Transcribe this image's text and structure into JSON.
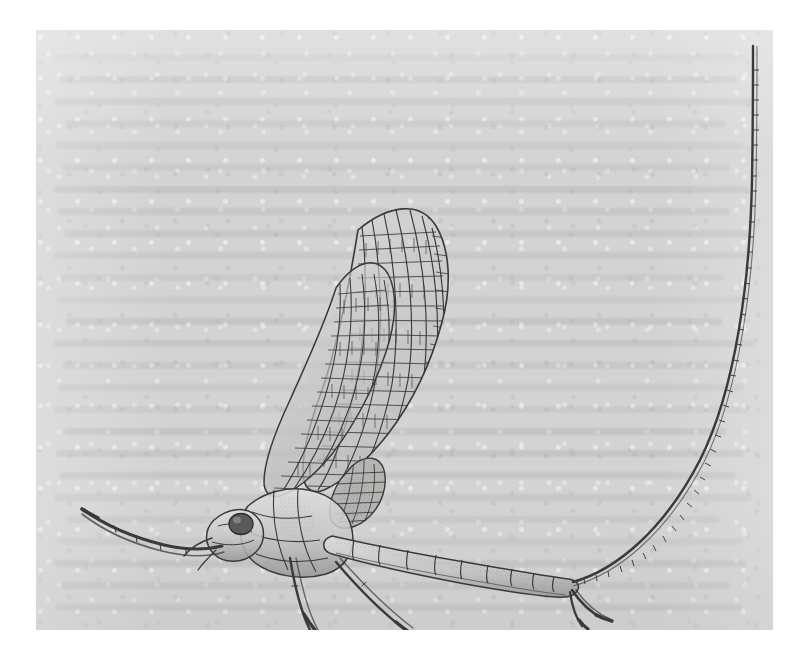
{
  "figure": {
    "subject_name": "mayfly-lateral-illustration",
    "title": "",
    "caption": "",
    "medium": "pen-and-ink line drawing",
    "view": "lateral",
    "plate": {
      "left": 36,
      "top": 30,
      "width": 737,
      "height": 600,
      "background_color": "#d2d3d2",
      "page_color": "#ffffff",
      "ink_color": "#3a3a38"
    },
    "background_marks": {
      "kind": "verso-bleed-through-text",
      "legible": false,
      "lines": [
        {
          "x": 18,
          "y": 24,
          "w": 690
        },
        {
          "x": 24,
          "y": 46,
          "w": 676
        },
        {
          "x": 18,
          "y": 68,
          "w": 700
        },
        {
          "x": 30,
          "y": 90,
          "w": 660
        },
        {
          "x": 20,
          "y": 112,
          "w": 688
        },
        {
          "x": 26,
          "y": 134,
          "w": 668
        },
        {
          "x": 18,
          "y": 156,
          "w": 694
        },
        {
          "x": 22,
          "y": 178,
          "w": 672
        },
        {
          "x": 28,
          "y": 200,
          "w": 684
        },
        {
          "x": 18,
          "y": 222,
          "w": 698
        },
        {
          "x": 24,
          "y": 244,
          "w": 664
        },
        {
          "x": 20,
          "y": 266,
          "w": 690
        },
        {
          "x": 30,
          "y": 288,
          "w": 656
        },
        {
          "x": 18,
          "y": 310,
          "w": 700
        },
        {
          "x": 26,
          "y": 332,
          "w": 670
        },
        {
          "x": 22,
          "y": 354,
          "w": 686
        },
        {
          "x": 18,
          "y": 376,
          "w": 694
        },
        {
          "x": 28,
          "y": 398,
          "w": 662
        },
        {
          "x": 20,
          "y": 420,
          "w": 688
        },
        {
          "x": 24,
          "y": 442,
          "w": 676
        },
        {
          "x": 18,
          "y": 464,
          "w": 698
        },
        {
          "x": 30,
          "y": 486,
          "w": 654
        },
        {
          "x": 22,
          "y": 508,
          "w": 684
        },
        {
          "x": 18,
          "y": 530,
          "w": 692
        },
        {
          "x": 26,
          "y": 552,
          "w": 668
        },
        {
          "x": 20,
          "y": 574,
          "w": 686
        }
      ]
    },
    "anatomy": [
      {
        "part": "head",
        "label": "head"
      },
      {
        "part": "compound-eye",
        "label": "compound eye"
      },
      {
        "part": "antenna",
        "label": "antenna"
      },
      {
        "part": "thorax",
        "label": "thorax"
      },
      {
        "part": "forewing",
        "label": "forewing",
        "count": 2,
        "venation": "dense polygonal crossveins"
      },
      {
        "part": "hindwing",
        "label": "hindwing",
        "count": 1
      },
      {
        "part": "abdomen",
        "label": "abdomen",
        "segments": 10
      },
      {
        "part": "foreleg",
        "label": "foreleg (extended forward)"
      },
      {
        "part": "midleg",
        "label": "midleg"
      },
      {
        "part": "hindleg",
        "label": "hindleg"
      },
      {
        "part": "forceps",
        "label": "genital forceps"
      },
      {
        "part": "cercus",
        "label": "cercus (caudal filament)",
        "count": 1,
        "note": "long segmented tail arcing to upper right"
      }
    ]
  }
}
